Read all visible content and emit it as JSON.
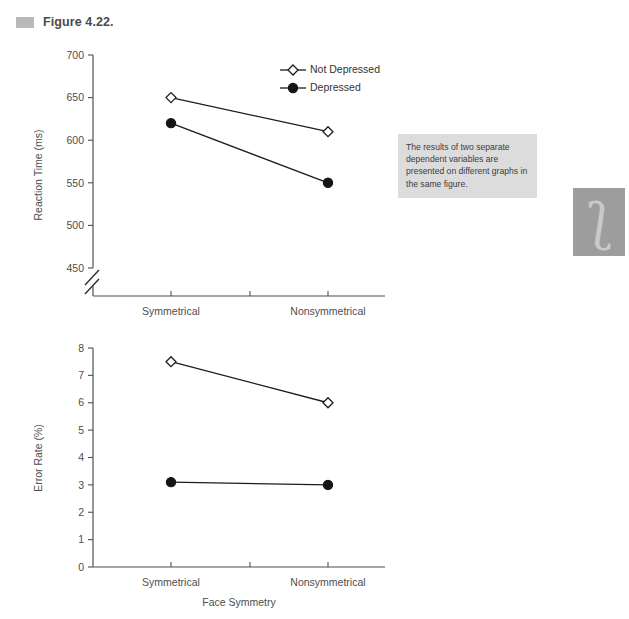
{
  "figure": {
    "marker_icon": "figure-bullet-icon",
    "title": "Figure 4.22."
  },
  "annotation": {
    "text": "The results of two separate dependent variables are presented on different graphs in the same figure."
  },
  "decoration": {
    "glyph": "ʃ",
    "background_color": "#9d9d9d",
    "glyph_color": "#c9c9c9"
  },
  "colors": {
    "ink": "#1c1c1c",
    "axis": "#4f4f4f",
    "label": "#4d4d4d",
    "marker_fill_depressed": "#151515",
    "marker_fill_not_depressed": "#ffffff",
    "annotation_background": "#dcdcdc",
    "figure_marker": "#b9b9b9"
  },
  "legend": {
    "position": "top-right",
    "entries": [
      {
        "label": "Not Depressed",
        "marker": "open-diamond"
      },
      {
        "label": "Depressed",
        "marker": "filled-circle"
      }
    ]
  },
  "chart_data": [
    {
      "type": "line",
      "id": "reaction-time",
      "title": "",
      "xlabel": "",
      "ylabel": "Reaction Time (ms)",
      "categories": [
        "Symmetrical",
        "Nonsymmetrical"
      ],
      "ylim": [
        450,
        700
      ],
      "yticks": [
        450,
        500,
        550,
        600,
        650,
        700
      ],
      "ytick_labels": [
        "450",
        "500",
        "550",
        "600",
        "650",
        "700"
      ],
      "axis_break": true,
      "grid": false,
      "legend_position": "top-right",
      "series": [
        {
          "name": "Not Depressed",
          "marker": "open-diamond",
          "values": [
            650,
            610
          ]
        },
        {
          "name": "Depressed",
          "marker": "filled-circle",
          "values": [
            620,
            550
          ]
        }
      ]
    },
    {
      "type": "line",
      "id": "error-rate",
      "title": "",
      "xlabel": "Face Symmetry",
      "ylabel": "Error Rate (%)",
      "categories": [
        "Symmetrical",
        "Nonsymmetrical"
      ],
      "ylim": [
        0,
        8
      ],
      "yticks": [
        0,
        1,
        2,
        3,
        4,
        5,
        6,
        7,
        8
      ],
      "ytick_labels": [
        "0",
        "1",
        "2",
        "3",
        "4",
        "5",
        "6",
        "7",
        "8"
      ],
      "axis_break": false,
      "grid": false,
      "legend_position": "none",
      "series": [
        {
          "name": "Not Depressed",
          "marker": "open-diamond",
          "values": [
            7.5,
            6.0
          ]
        },
        {
          "name": "Depressed",
          "marker": "filled-circle",
          "values": [
            3.1,
            3.0
          ]
        }
      ]
    }
  ]
}
